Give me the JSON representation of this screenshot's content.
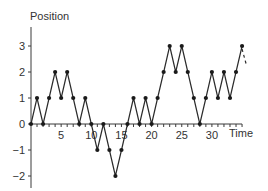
{
  "chart_data": {
    "type": "line",
    "title": "",
    "xlabel": "Time",
    "ylabel": "Position",
    "x": [
      0,
      1,
      2,
      3,
      4,
      5,
      6,
      7,
      8,
      9,
      10,
      11,
      12,
      13,
      14,
      15,
      16,
      17,
      18,
      19,
      20,
      21,
      22,
      23,
      24,
      25,
      26,
      27,
      28,
      29,
      30,
      31,
      32,
      33,
      34,
      35
    ],
    "series": [
      {
        "name": "Random walk",
        "values": [
          0,
          1,
          0,
          1,
          2,
          1,
          2,
          1,
          0,
          1,
          0,
          -1,
          0,
          -1,
          -2,
          -1,
          0,
          1,
          0,
          1,
          0,
          1,
          2,
          3,
          2,
          3,
          2,
          1,
          0,
          1,
          2,
          1,
          2,
          1,
          2,
          3
        ],
        "markers": true
      }
    ],
    "continuation": {
      "from": [
        35,
        3
      ],
      "toward": [
        36,
        2
      ],
      "style": "dashed"
    },
    "x_ticks": [
      5,
      10,
      15,
      20,
      25,
      30
    ],
    "x_tick_labels": [
      "5",
      "10",
      "15",
      "20",
      "25",
      "30"
    ],
    "y_ticks": [
      -2,
      -1,
      0,
      1,
      2,
      3
    ],
    "y_tick_labels": [
      "−2",
      "−1",
      "0",
      "1",
      "2",
      "3"
    ],
    "xlim": [
      0,
      35
    ],
    "ylim": [
      -2.5,
      3.7
    ],
    "grid": false,
    "legend": "none"
  }
}
